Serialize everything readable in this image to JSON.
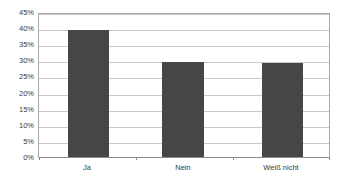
{
  "chart_data": {
    "type": "bar",
    "title": "",
    "subtitle": "",
    "xlabel": "",
    "ylabel": "",
    "categories": [
      "Ja",
      "Nein",
      "Weiß nicht"
    ],
    "values": [
      40,
      30,
      29.5
    ],
    "value_format": "percent",
    "ylim": [
      0,
      45
    ],
    "ytick_step": 5,
    "yticks": [
      45,
      40,
      35,
      30,
      25,
      20,
      15,
      10,
      5,
      0
    ],
    "ytick_labels": [
      "45%",
      "40%",
      "35%",
      "30%",
      "25%",
      "20%",
      "15%",
      "10%",
      "5%",
      "0%"
    ],
    "grid": {
      "horizontal": true,
      "vertical": false
    },
    "legend": {
      "visible": false,
      "position": "none",
      "entries": []
    },
    "series": [
      {
        "name": "Anteil",
        "values": [
          40,
          30,
          29.5
        ]
      }
    ],
    "annotations": []
  },
  "style": {
    "bar_color": "#464646",
    "gridline_color": "#c9c9c9",
    "axis_line_color": "#8d8d8d",
    "plot_border_color": "#a8a8a8",
    "plot_background": "#ffffff",
    "page_background": "#ffffff",
    "text_color": "#3a3a3a"
  }
}
